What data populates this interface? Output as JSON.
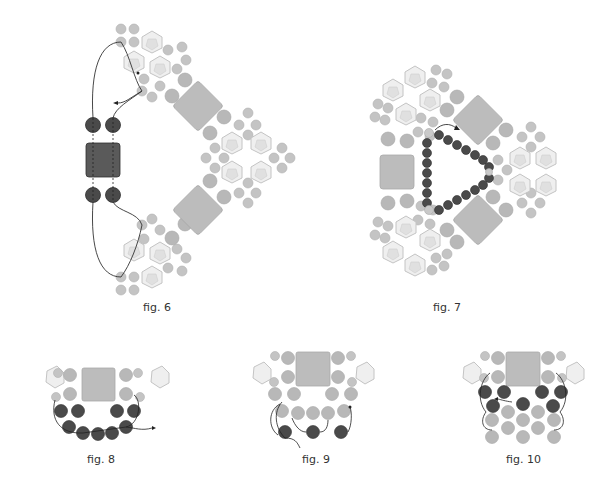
{
  "figures": [
    {
      "id": "fig6",
      "caption": "fig. 6"
    },
    {
      "id": "fig7",
      "caption": "fig. 7"
    },
    {
      "id": "fig8",
      "caption": "fig. 8"
    },
    {
      "id": "fig9",
      "caption": "fig. 9"
    },
    {
      "id": "fig10",
      "caption": "fig. 10"
    }
  ],
  "colors": {
    "background": "#ffffff",
    "light_bead": "#bdbdbd",
    "light_bead_stroke": "#a9a9a9",
    "dark_bead": "#4a4a4a",
    "dark_bead_stroke": "#2e2e2e",
    "square_bead": "#b9b9b9",
    "dark_square_bead": "#5a5a5a",
    "crystal_fill": "#efefef",
    "crystal_stroke": "#c4c4c4",
    "thread": "#333333",
    "caption_text": "#333333"
  }
}
